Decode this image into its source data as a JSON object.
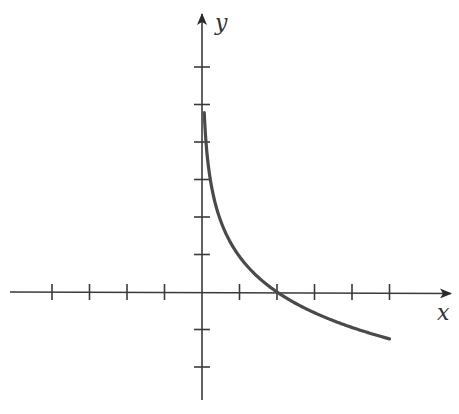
{
  "labels": {
    "x_axis": "x",
    "y_axis": "y"
  },
  "colors": {
    "axes": "#3a3a3a",
    "curve": "#4a4a4a",
    "background": "#ffffff"
  },
  "chart_data": {
    "type": "line",
    "title": "",
    "xlabel": "x",
    "ylabel": "y",
    "xlim": [
      -4,
      6
    ],
    "ylim": [
      -2,
      6
    ],
    "grid": false,
    "x_ticks": [
      -4,
      -3,
      -2,
      -1,
      1,
      2,
      3,
      4,
      5
    ],
    "y_ticks": [
      -2,
      -1,
      1,
      2,
      3,
      4,
      5,
      6
    ],
    "tick_labels_shown": false,
    "series": [
      {
        "name": "decreasing logarithmic curve",
        "x": [
          0.06,
          0.1,
          0.2,
          0.3,
          0.5,
          0.75,
          1,
          1.5,
          2,
          2.5,
          3,
          3.5,
          4,
          4.5,
          5
        ],
        "y": [
          4.78,
          4.09,
          3.14,
          2.59,
          1.89,
          1.34,
          0.95,
          0.39,
          0.0,
          -0.3,
          -0.55,
          -0.76,
          -0.95,
          -1.11,
          -1.25
        ]
      }
    ],
    "annotations": [
      "curve has vertical asymptote at x = 0",
      "x-intercept at x = 2"
    ]
  },
  "layout": {
    "origin_px": [
      202,
      292
    ],
    "unit_px": 37.5
  }
}
